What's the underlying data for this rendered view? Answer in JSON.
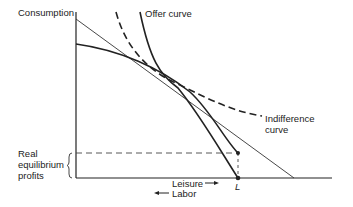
{
  "diagram": {
    "y_axis_label": "Consumption",
    "offer_curve_label": "Offer curve",
    "indifference_label_line1": "Indifference",
    "indifference_label_line2": "curve",
    "profits_label_line1": "Real",
    "profits_label_line2": "equilibrium",
    "profits_label_line3": "profits",
    "leisure_label": "Leisure",
    "labor_label": "Labor",
    "point_label": "L",
    "colors": {
      "ink": "#222222",
      "background": "#ffffff"
    }
  }
}
